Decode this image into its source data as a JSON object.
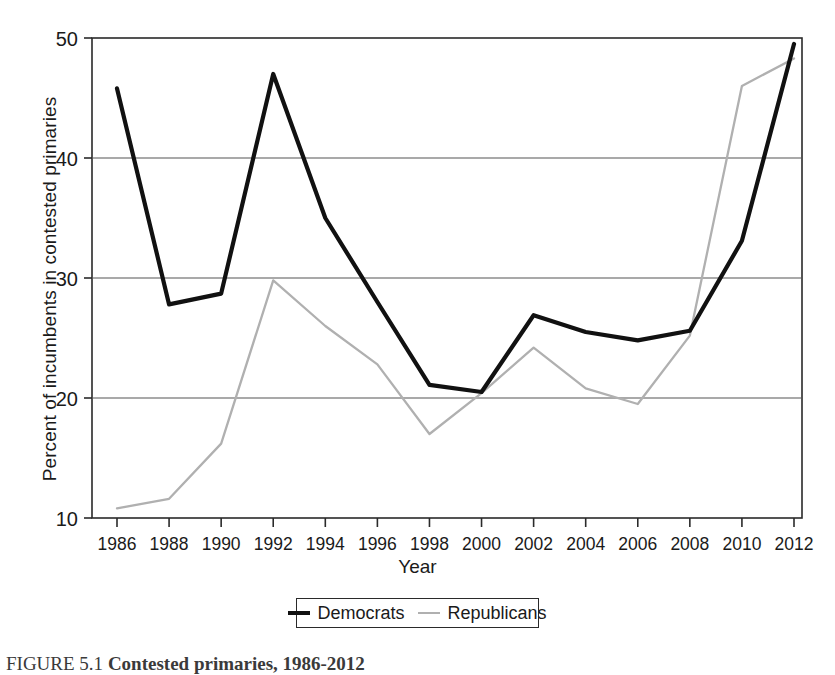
{
  "figure": {
    "caption_prefix": "FIGURE 5.1",
    "caption_title": "Contested primaries, 1986-2012",
    "caption_full": "FIGURE 5.1  Contested primaries, 1986-2012"
  },
  "legend": {
    "democrats_label": "Democrats",
    "republicans_label": "Republicans"
  },
  "colors": {
    "democrats": "#111111",
    "republicans": "#b0b0b0",
    "axis": "#2a2a2a",
    "gridline": "#555555",
    "background": "#ffffff"
  },
  "chart_data": {
    "type": "line",
    "title": "Contested primaries, 1986-2012",
    "xlabel": "Year",
    "ylabel": "Percent of incumbents in contested primaries",
    "x": [
      1986,
      1988,
      1990,
      1992,
      1994,
      1996,
      1998,
      2000,
      2002,
      2004,
      2006,
      2008,
      2010,
      2012
    ],
    "xtick_labels": [
      "1986",
      "1988",
      "1990",
      "1992",
      "1994",
      "1996",
      "1998",
      "2000",
      "2002",
      "2004",
      "2006",
      "2008",
      "2010",
      "2012"
    ],
    "ytick_labels": [
      "10",
      "20",
      "30",
      "40",
      "50"
    ],
    "yticks": [
      10,
      20,
      30,
      40,
      50
    ],
    "ylim": [
      10,
      50
    ],
    "xlim": [
      1986,
      2012
    ],
    "grid": "horizontal",
    "legend_position": "below-axis-center",
    "series": [
      {
        "name": "Democrats",
        "color": "#111111",
        "values": [
          45.8,
          27.8,
          28.7,
          47.0,
          35.0,
          28.0,
          21.1,
          20.5,
          26.9,
          25.5,
          24.8,
          25.6,
          33.1,
          49.5
        ]
      },
      {
        "name": "Republicans",
        "color": "#b0b0b0",
        "values": [
          10.8,
          11.6,
          16.2,
          29.8,
          26.0,
          22.8,
          17.0,
          20.4,
          24.2,
          20.8,
          19.5,
          25.2,
          46.0,
          48.3
        ]
      }
    ]
  }
}
